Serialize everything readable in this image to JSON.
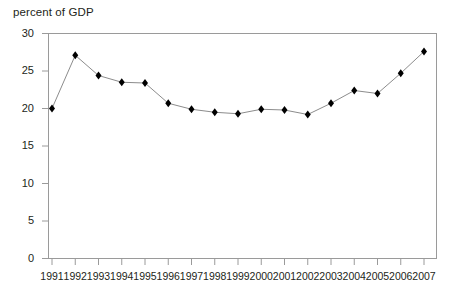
{
  "chart_data": {
    "type": "line",
    "title": "",
    "ylabel": "percent of GDP",
    "xlabel": "",
    "categories": [
      "1991",
      "1992",
      "1993",
      "1994",
      "1995",
      "1996",
      "1997",
      "1998",
      "1999",
      "2000",
      "2001",
      "2002",
      "2003",
      "2004",
      "2005",
      "2006",
      "2007"
    ],
    "values": [
      20.0,
      27.1,
      24.4,
      23.5,
      23.4,
      20.7,
      19.9,
      19.5,
      19.3,
      19.9,
      19.8,
      19.2,
      20.7,
      22.4,
      22.0,
      24.7,
      27.6
    ],
    "series": [
      {
        "name": "percent of GDP",
        "values": [
          20.0,
          27.1,
          24.4,
          23.5,
          23.4,
          20.7,
          19.9,
          19.5,
          19.3,
          19.9,
          19.8,
          19.2,
          20.7,
          22.4,
          22.0,
          24.7,
          27.6
        ]
      }
    ],
    "ylim": [
      0,
      30
    ],
    "yticks": [
      0,
      5,
      10,
      15,
      20,
      25,
      30
    ],
    "ytick_labels": [
      "0",
      "5",
      "10",
      "15",
      "20",
      "25",
      "30"
    ],
    "grid": false,
    "legend": "none",
    "marker": "diamond",
    "line_color": "#8c8c8c",
    "marker_color": "#000000",
    "frame_color": "#9a9a9a",
    "background": "#ffffff"
  },
  "labels": {
    "y_axis_caption": "percent of GDP"
  }
}
